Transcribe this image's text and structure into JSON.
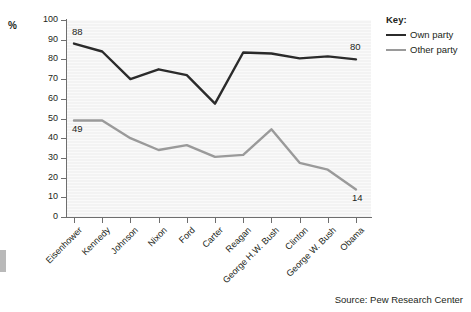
{
  "axis": {
    "y_unit_label": "%",
    "y_ticks": [
      "100",
      "90",
      "80",
      "70",
      "60",
      "50",
      "40",
      "30",
      "20",
      "10",
      "0"
    ]
  },
  "legend": {
    "title": "Key:",
    "entries": [
      {
        "label": "Own party",
        "color": "#2b2b2b"
      },
      {
        "label": "Other party",
        "color": "#9a9a9a"
      }
    ]
  },
  "source": "Source: Pew Research Center",
  "callouts": [
    {
      "text": "88"
    },
    {
      "text": "80"
    },
    {
      "text": "49"
    },
    {
      "text": "14"
    }
  ],
  "chart_data": {
    "type": "line",
    "title": "",
    "xlabel": "",
    "ylabel": "%",
    "ylim": [
      0,
      100
    ],
    "ytick_step": 10,
    "grid": false,
    "legend_position": "right",
    "categories": [
      "Eisenhower",
      "Kennedy",
      "Johnson",
      "Nixon",
      "Ford",
      "Carter",
      "Reagan",
      "George H.W. Bush",
      "Clinton",
      "George W. Bush",
      "Obama"
    ],
    "series": [
      {
        "name": "Own party",
        "color": "#2b2b2b",
        "values": [
          88,
          84,
          70,
          75,
          72,
          57.5,
          83.5,
          83,
          80.5,
          81.5,
          80
        ]
      },
      {
        "name": "Other party",
        "color": "#9a9a9a",
        "values": [
          49,
          49,
          40,
          34,
          36.5,
          30.5,
          31.5,
          44.5,
          27.5,
          24,
          14
        ]
      }
    ],
    "annotations": [
      {
        "series": "Own party",
        "category": "Eisenhower",
        "value": 88,
        "text": "88"
      },
      {
        "series": "Own party",
        "category": "Obama",
        "value": 80,
        "text": "80"
      },
      {
        "series": "Other party",
        "category": "Eisenhower",
        "value": 49,
        "text": "49"
      },
      {
        "series": "Other party",
        "category": "Obama",
        "value": 14,
        "text": "14"
      }
    ]
  }
}
